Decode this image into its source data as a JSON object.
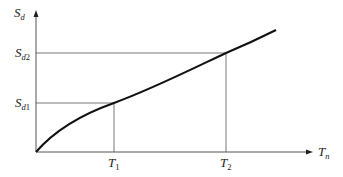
{
  "diagram": {
    "type": "spectral-displacement-vs-period",
    "axes": {
      "y": {
        "symbol": "S",
        "subscript": "d"
      },
      "x": {
        "symbol": "T",
        "subscript": "n"
      }
    },
    "y_marks": [
      {
        "symbol": "S",
        "sub_italic": "d",
        "sub_normal": "2"
      },
      {
        "symbol": "S",
        "sub_italic": "d",
        "sub_normal": "1"
      }
    ],
    "x_marks": [
      {
        "symbol": "T",
        "sub_normal": "1"
      },
      {
        "symbol": "T",
        "sub_normal": "2"
      }
    ],
    "colors": {
      "axis": "#555555",
      "curve": "#111111",
      "guide": "#555555"
    }
  }
}
